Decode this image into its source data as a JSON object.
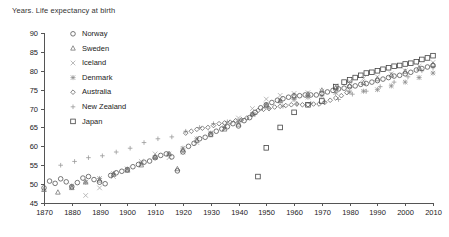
{
  "title": "Years. Life expectancy at birth",
  "legend": {
    "position": "upper-left",
    "items": [
      {
        "label": "Norway",
        "marker": "circle",
        "color": "#555555"
      },
      {
        "label": "Sweden",
        "marker": "triangle",
        "color": "#777777"
      },
      {
        "label": "Iceland",
        "marker": "cross-x",
        "color": "#aaaaaa"
      },
      {
        "label": "Denmark",
        "marker": "asterisk",
        "color": "#888888"
      },
      {
        "label": "Australia",
        "marker": "diamond",
        "color": "#666666"
      },
      {
        "label": "New Zealand",
        "marker": "plus",
        "color": "#999999"
      },
      {
        "label": "Japan",
        "marker": "square",
        "color": "#444444"
      }
    ]
  },
  "axes": {
    "y_ticks": [
      45,
      50,
      55,
      60,
      65,
      70,
      75,
      80,
      85,
      90
    ],
    "x_ticks": [
      1870,
      1880,
      1890,
      1900,
      1910,
      1920,
      1930,
      1940,
      1950,
      1960,
      1970,
      1980,
      1990,
      2000,
      2010
    ],
    "xlim": [
      1870,
      2010
    ],
    "ylim": [
      45,
      90
    ],
    "grid": false,
    "xlabel": "",
    "ylabel": ""
  },
  "chart_data": {
    "type": "scatter",
    "title": "Years. Life expectancy at birth",
    "xlabel": "",
    "ylabel": "Years",
    "xlim": [
      1870,
      2010
    ],
    "ylim": [
      45,
      90
    ],
    "grid": false,
    "legend_position": "upper-left",
    "series": [
      {
        "name": "Norway",
        "marker": "circle",
        "color": "#555555",
        "points": [
          [
            1870,
            49.0
          ],
          [
            1872,
            50.8
          ],
          [
            1874,
            50.2
          ],
          [
            1876,
            51.4
          ],
          [
            1878,
            50.6
          ],
          [
            1880,
            49.3
          ],
          [
            1882,
            50.4
          ],
          [
            1884,
            51.6
          ],
          [
            1886,
            52.0
          ],
          [
            1888,
            51.2
          ],
          [
            1890,
            50.5
          ],
          [
            1892,
            50.1
          ],
          [
            1894,
            52.3
          ],
          [
            1896,
            53.0
          ],
          [
            1898,
            53.4
          ],
          [
            1900,
            53.8
          ],
          [
            1902,
            54.6
          ],
          [
            1904,
            55.2
          ],
          [
            1906,
            55.8
          ],
          [
            1908,
            56.1
          ],
          [
            1910,
            57.0
          ],
          [
            1912,
            57.6
          ],
          [
            1914,
            58.0
          ],
          [
            1916,
            57.2
          ],
          [
            1918,
            53.5
          ],
          [
            1920,
            58.5
          ],
          [
            1922,
            60.0
          ],
          [
            1924,
            60.8
          ],
          [
            1926,
            62.0
          ],
          [
            1928,
            62.4
          ],
          [
            1930,
            63.2
          ],
          [
            1932,
            64.0
          ],
          [
            1934,
            64.6
          ],
          [
            1936,
            65.2
          ],
          [
            1938,
            66.0
          ],
          [
            1940,
            65.4
          ],
          [
            1942,
            66.8
          ],
          [
            1944,
            67.6
          ],
          [
            1946,
            69.0
          ],
          [
            1948,
            70.2
          ],
          [
            1950,
            71.0
          ],
          [
            1952,
            71.6
          ],
          [
            1954,
            72.2
          ],
          [
            1956,
            72.6
          ],
          [
            1958,
            73.0
          ],
          [
            1960,
            73.4
          ],
          [
            1962,
            73.4
          ],
          [
            1964,
            73.6
          ],
          [
            1966,
            73.6
          ],
          [
            1968,
            73.6
          ],
          [
            1970,
            74.0
          ],
          [
            1972,
            74.4
          ],
          [
            1974,
            74.8
          ],
          [
            1976,
            75.2
          ],
          [
            1978,
            75.4
          ],
          [
            1980,
            75.8
          ],
          [
            1982,
            76.0
          ],
          [
            1984,
            76.4
          ],
          [
            1986,
            76.6
          ],
          [
            1988,
            77.0
          ],
          [
            1990,
            77.4
          ],
          [
            1992,
            77.8
          ],
          [
            1994,
            78.2
          ],
          [
            1996,
            78.6
          ],
          [
            1998,
            78.8
          ],
          [
            2000,
            79.2
          ],
          [
            2002,
            79.6
          ],
          [
            2004,
            80.2
          ],
          [
            2006,
            80.6
          ],
          [
            2008,
            81.0
          ],
          [
            2010,
            81.4
          ]
        ]
      },
      {
        "name": "Sweden",
        "marker": "triangle",
        "color": "#777777",
        "points": [
          [
            1870,
            48.5
          ],
          [
            1875,
            47.8
          ],
          [
            1880,
            49.0
          ],
          [
            1885,
            50.5
          ],
          [
            1890,
            51.0
          ],
          [
            1895,
            52.5
          ],
          [
            1900,
            53.6
          ],
          [
            1905,
            55.0
          ],
          [
            1910,
            57.2
          ],
          [
            1915,
            58.0
          ],
          [
            1918,
            54.0
          ],
          [
            1920,
            59.0
          ],
          [
            1925,
            61.5
          ],
          [
            1930,
            63.0
          ],
          [
            1935,
            64.5
          ],
          [
            1940,
            65.8
          ],
          [
            1945,
            68.5
          ],
          [
            1950,
            70.8
          ],
          [
            1955,
            72.0
          ],
          [
            1960,
            73.2
          ],
          [
            1965,
            73.8
          ],
          [
            1970,
            74.8
          ],
          [
            1975,
            75.4
          ],
          [
            1980,
            76.0
          ],
          [
            1985,
            76.8
          ],
          [
            1990,
            77.8
          ],
          [
            1995,
            78.8
          ],
          [
            2000,
            79.8
          ],
          [
            2005,
            80.6
          ],
          [
            2010,
            81.6
          ]
        ]
      },
      {
        "name": "Iceland",
        "marker": "cross-x",
        "color": "#aaaaaa",
        "points": [
          [
            1880,
            44.5
          ],
          [
            1885,
            47.0
          ],
          [
            1890,
            49.0
          ],
          [
            1895,
            52.0
          ],
          [
            1900,
            54.0
          ],
          [
            1905,
            56.0
          ],
          [
            1910,
            58.0
          ],
          [
            1915,
            57.0
          ],
          [
            1920,
            58.5
          ],
          [
            1925,
            61.0
          ],
          [
            1930,
            63.5
          ],
          [
            1935,
            65.5
          ],
          [
            1940,
            67.5
          ],
          [
            1945,
            70.0
          ],
          [
            1950,
            72.5
          ],
          [
            1955,
            73.5
          ],
          [
            1960,
            74.0
          ],
          [
            1965,
            74.2
          ],
          [
            1970,
            74.6
          ],
          [
            1975,
            76.0
          ],
          [
            1980,
            77.2
          ],
          [
            1985,
            78.0
          ],
          [
            1990,
            78.4
          ],
          [
            1995,
            79.2
          ],
          [
            2000,
            80.0
          ],
          [
            2005,
            81.2
          ],
          [
            2010,
            82.2
          ]
        ]
      },
      {
        "name": "Denmark",
        "marker": "asterisk",
        "color": "#888888",
        "points": [
          [
            1880,
            49.5
          ],
          [
            1885,
            50.5
          ],
          [
            1890,
            51.5
          ],
          [
            1895,
            52.8
          ],
          [
            1900,
            54.0
          ],
          [
            1905,
            55.5
          ],
          [
            1910,
            57.0
          ],
          [
            1915,
            58.0
          ],
          [
            1920,
            59.5
          ],
          [
            1925,
            62.0
          ],
          [
            1930,
            63.5
          ],
          [
            1935,
            65.0
          ],
          [
            1940,
            66.5
          ],
          [
            1945,
            68.5
          ],
          [
            1950,
            71.0
          ],
          [
            1955,
            72.0
          ],
          [
            1960,
            72.4
          ],
          [
            1965,
            73.0
          ],
          [
            1970,
            73.4
          ],
          [
            1975,
            74.2
          ],
          [
            1980,
            74.4
          ],
          [
            1985,
            74.6
          ],
          [
            1990,
            75.0
          ],
          [
            1995,
            76.0
          ],
          [
            2000,
            77.0
          ],
          [
            2005,
            78.2
          ],
          [
            2010,
            79.4
          ]
        ]
      },
      {
        "name": "Australia",
        "marker": "diamond",
        "color": "#666666",
        "points": [
          [
            1921,
            63.5
          ],
          [
            1923,
            64.0
          ],
          [
            1925,
            64.5
          ],
          [
            1927,
            64.8
          ],
          [
            1929,
            65.0
          ],
          [
            1931,
            65.5
          ],
          [
            1933,
            66.0
          ],
          [
            1935,
            66.2
          ],
          [
            1937,
            66.4
          ],
          [
            1939,
            66.8
          ],
          [
            1941,
            67.0
          ],
          [
            1943,
            67.5
          ],
          [
            1945,
            68.5
          ],
          [
            1947,
            69.5
          ],
          [
            1949,
            69.8
          ],
          [
            1951,
            70.0
          ],
          [
            1953,
            70.4
          ],
          [
            1955,
            70.6
          ],
          [
            1957,
            70.8
          ],
          [
            1959,
            71.0
          ],
          [
            1961,
            71.2
          ],
          [
            1963,
            71.0
          ],
          [
            1965,
            71.0
          ],
          [
            1967,
            71.2
          ],
          [
            1969,
            71.2
          ],
          [
            1971,
            71.6
          ],
          [
            1973,
            72.2
          ],
          [
            1975,
            72.8
          ],
          [
            1977,
            73.4
          ],
          [
            1979,
            74.2
          ]
        ]
      },
      {
        "name": "New Zealand",
        "marker": "plus",
        "color": "#999999",
        "points": [
          [
            1876,
            55.0
          ],
          [
            1881,
            56.0
          ],
          [
            1886,
            57.0
          ],
          [
            1891,
            57.5
          ],
          [
            1896,
            58.5
          ],
          [
            1901,
            59.5
          ],
          [
            1906,
            61.0
          ],
          [
            1911,
            62.0
          ],
          [
            1916,
            62.5
          ],
          [
            1921,
            64.0
          ],
          [
            1926,
            65.0
          ],
          [
            1931,
            66.0
          ],
          [
            1936,
            66.5
          ],
          [
            1941,
            67.0
          ],
          [
            1946,
            68.5
          ],
          [
            1951,
            70.0
          ],
          [
            1956,
            70.6
          ],
          [
            1961,
            71.2
          ],
          [
            1966,
            71.4
          ],
          [
            1971,
            71.8
          ],
          [
            1976,
            72.4
          ],
          [
            1981,
            73.8
          ],
          [
            1986,
            74.6
          ],
          [
            1991,
            75.8
          ],
          [
            1996,
            77.0
          ],
          [
            2001,
            78.4
          ],
          [
            2006,
            80.0
          ],
          [
            2010,
            80.8
          ]
        ]
      },
      {
        "name": "Japan",
        "marker": "square",
        "color": "#444444",
        "points": [
          [
            1947,
            52.0
          ],
          [
            1950,
            59.6
          ],
          [
            1955,
            65.0
          ],
          [
            1960,
            69.0
          ],
          [
            1965,
            71.0
          ],
          [
            1970,
            72.0
          ],
          [
            1975,
            75.8
          ],
          [
            1978,
            77.0
          ],
          [
            1980,
            77.6
          ],
          [
            1982,
            78.2
          ],
          [
            1984,
            78.8
          ],
          [
            1986,
            79.4
          ],
          [
            1988,
            79.6
          ],
          [
            1990,
            80.0
          ],
          [
            1992,
            80.4
          ],
          [
            1994,
            80.8
          ],
          [
            1996,
            81.2
          ],
          [
            1998,
            81.4
          ],
          [
            2000,
            81.8
          ],
          [
            2002,
            82.0
          ],
          [
            2004,
            82.4
          ],
          [
            2006,
            83.0
          ],
          [
            2008,
            83.4
          ],
          [
            2010,
            84.0
          ],
          [
            2011,
            85.0
          ],
          [
            2012,
            86.0
          ]
        ]
      }
    ]
  }
}
